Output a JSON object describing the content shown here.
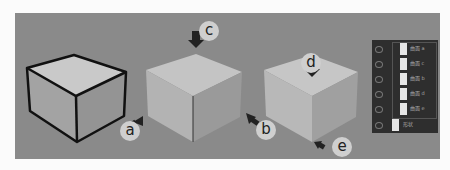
{
  "diagram": {
    "labels": {
      "a": "a",
      "b": "b",
      "c": "c",
      "d": "d",
      "e": "e"
    },
    "colors": {
      "background": "#8a8a8a",
      "cube_outline": "#111111",
      "cube_top": "#c9c9c9",
      "cube_left": "#a3a3a3",
      "cube_right": "#949494",
      "shaded_top": "#c4c4c4",
      "shaded_left": "#b3b3b3",
      "shaded_right": "#9a9a9a",
      "layer_panel": "#2e2e2e"
    },
    "layers": [
      {
        "name": "曲面 a",
        "icon": "eye-icon"
      },
      {
        "name": "曲面 c",
        "icon": "eye-icon"
      },
      {
        "name": "曲面 b",
        "icon": "eye-icon"
      },
      {
        "name": "曲面 d",
        "icon": "eye-icon"
      },
      {
        "name": "曲面 e",
        "icon": "eye-icon"
      },
      {
        "name": "形状",
        "icon": "eye-icon"
      }
    ]
  }
}
